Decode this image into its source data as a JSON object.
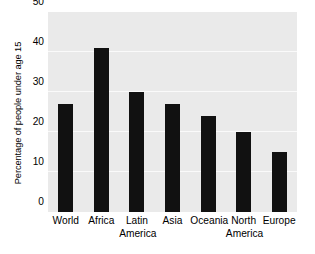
{
  "chart_data": {
    "type": "bar",
    "title": "",
    "xlabel": "",
    "ylabel": "Percentage of people under age 15",
    "categories": [
      "World",
      "Africa",
      "Latin\nAmerica",
      "Asia",
      "Oceania",
      "North\nAmerica",
      "Europe"
    ],
    "values": [
      27,
      41,
      30,
      27,
      24,
      20,
      15
    ],
    "ylim": [
      0,
      50
    ],
    "ytick_labels": [
      "0",
      "10",
      "20",
      "30",
      "40",
      "50"
    ],
    "ytick_values": [
      0,
      10,
      20,
      30,
      40,
      50
    ],
    "grid": true,
    "grid_axis": "y",
    "legend": "none",
    "colors": {
      "bar": "#111111",
      "plot_background": "#eaeaea",
      "gridline": "#fafafa",
      "figure_background": "#ffffff",
      "text": "#000000"
    }
  }
}
